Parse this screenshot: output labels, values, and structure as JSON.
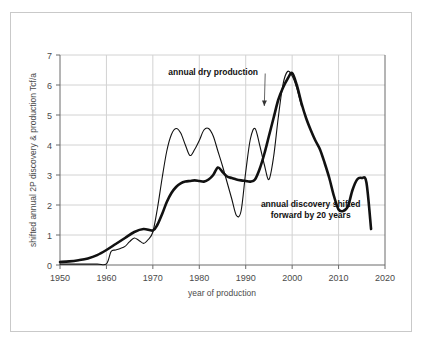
{
  "chart_data": {
    "type": "line",
    "title": "",
    "xlabel": "year of production",
    "ylabel": "shifted annual 2P discovery & production Tcf/a",
    "xlim": [
      1950,
      2020
    ],
    "ylim": [
      0,
      7
    ],
    "xticks": [
      1950,
      1960,
      1970,
      1980,
      1990,
      2000,
      2010,
      2020
    ],
    "yticks": [
      0,
      1,
      2,
      3,
      4,
      5,
      6,
      7
    ],
    "grid": true,
    "legend_position": "inline-annotations",
    "annotations": [
      {
        "text": "annual dry production",
        "x": 1983,
        "y": 6.35,
        "leader_to_x": 1994,
        "leader_to_y": 5.3
      },
      {
        "text_line1": "annual discovery shifted",
        "text_line2": "forward by 20 years",
        "x": 2004,
        "y": 1.95
      }
    ],
    "series": [
      {
        "name": "annual dry production",
        "style": "thick",
        "x": [
          1950,
          1952,
          1954,
          1956,
          1958,
          1960,
          1962,
          1964,
          1966,
          1968,
          1970,
          1971,
          1972,
          1973,
          1974,
          1975,
          1976,
          1977,
          1978,
          1979,
          1980,
          1981,
          1982,
          1983,
          1984,
          1985,
          1986,
          1987,
          1988,
          1989,
          1990,
          1991,
          1992,
          1993,
          1994,
          1995,
          1996,
          1997,
          1998,
          1999,
          2000,
          2001,
          2002,
          2003,
          2004,
          2005,
          2006,
          2007,
          2008,
          2009,
          2010,
          2011,
          2012,
          2013,
          2014,
          2015,
          2016,
          2017
        ],
        "y": [
          0.1,
          0.12,
          0.16,
          0.22,
          0.33,
          0.5,
          0.7,
          0.9,
          1.1,
          1.2,
          1.15,
          1.35,
          1.7,
          2.1,
          2.4,
          2.6,
          2.72,
          2.78,
          2.8,
          2.82,
          2.8,
          2.78,
          2.85,
          3.0,
          3.25,
          3.1,
          2.95,
          2.9,
          2.85,
          2.82,
          2.8,
          2.78,
          2.85,
          3.2,
          3.7,
          4.3,
          4.9,
          5.5,
          5.9,
          6.2,
          6.4,
          6.0,
          5.4,
          4.9,
          4.5,
          4.15,
          3.85,
          3.4,
          2.9,
          2.3,
          1.85,
          1.8,
          1.95,
          2.5,
          2.85,
          2.9,
          2.75,
          1.2
        ]
      },
      {
        "name": "annual discovery shifted forward by 20 years",
        "style": "thin",
        "x": [
          1950,
          1954,
          1958,
          1960,
          1961,
          1962,
          1963,
          1964,
          1965,
          1966,
          1967,
          1968,
          1969,
          1970,
          1971,
          1972,
          1973,
          1974,
          1975,
          1976,
          1977,
          1978,
          1979,
          1980,
          1981,
          1982,
          1983,
          1984,
          1985,
          1986,
          1987,
          1988,
          1989,
          1990,
          1991,
          1992,
          1993,
          1994,
          1995,
          1996,
          1997,
          1998,
          1999,
          2000,
          2001,
          2002
        ],
        "y": [
          0.03,
          0.03,
          0.03,
          0.04,
          0.45,
          0.5,
          0.55,
          0.62,
          0.78,
          0.9,
          0.82,
          0.72,
          0.85,
          1.1,
          1.9,
          2.9,
          3.8,
          4.35,
          4.55,
          4.4,
          4.0,
          3.65,
          3.85,
          4.15,
          4.5,
          4.55,
          4.3,
          3.8,
          3.3,
          2.75,
          2.2,
          1.65,
          1.8,
          3.1,
          4.2,
          4.55,
          4.0,
          3.35,
          2.85,
          3.6,
          4.9,
          6.0,
          6.45,
          6.3,
          5.9,
          5.3
        ]
      }
    ]
  }
}
